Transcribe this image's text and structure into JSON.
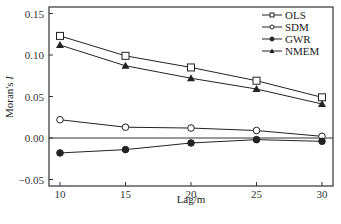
{
  "chart_data": {
    "type": "line",
    "title": "",
    "xlabel": "Lag/m",
    "ylabel": "Moran's I",
    "x": [
      10,
      15,
      20,
      25,
      30
    ],
    "xticks": [
      "10",
      "15",
      "20",
      "25",
      "30"
    ],
    "yticks": [
      "0.15",
      "0.10",
      "0.05",
      "0.00",
      "-0.05"
    ],
    "xlim": [
      9.2,
      30.8
    ],
    "ylim": [
      -0.058,
      0.158
    ],
    "grid": false,
    "zero_line": true,
    "legend_position": "upper right",
    "series": [
      {
        "name": "OLS",
        "marker": "open-square",
        "values": [
          0.123,
          0.099,
          0.085,
          0.069,
          0.049
        ]
      },
      {
        "name": "SDM",
        "marker": "open-circle",
        "values": [
          0.022,
          0.013,
          0.012,
          0.009,
          0.002
        ]
      },
      {
        "name": "GWR",
        "marker": "filled-circle",
        "values": [
          -0.018,
          -0.014,
          -0.006,
          -0.002,
          -0.004
        ]
      },
      {
        "name": "NMEM",
        "marker": "filled-triangle",
        "values": [
          0.112,
          0.087,
          0.072,
          0.059,
          0.041
        ]
      }
    ]
  },
  "colors": {
    "line": "#222222",
    "frame": "#333333"
  }
}
